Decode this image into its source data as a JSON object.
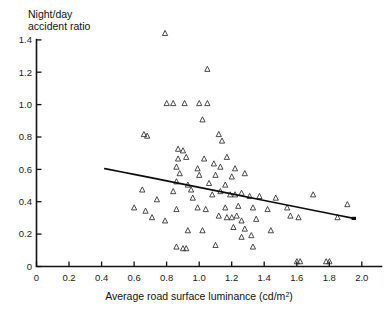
{
  "chart_data": {
    "type": "scatter",
    "title": "",
    "ylabel_line1": "Night/day",
    "ylabel_line2": "accident ratio",
    "xlabel_main": "Average road surface luminance (cd/m",
    "xlabel_sup": "2",
    "xlabel_tail": ")",
    "xlabel_full": "Average road surface luminance (cd/m2)",
    "ylabel_full": "Night/day accident ratio",
    "xlim": [
      0,
      2.12
    ],
    "ylim": [
      0,
      1.42
    ],
    "xticks": [
      0,
      0.2,
      0.4,
      0.6,
      0.8,
      1.0,
      1.2,
      1.4,
      1.6,
      1.8,
      2.0
    ],
    "xtick_labels": [
      "0",
      "0.2",
      "0.4",
      "0.6",
      "0.8",
      "1.0",
      "1.2",
      "1.4",
      "1.6",
      "1.8",
      "2.0"
    ],
    "yticks": [
      0,
      0.2,
      0.4,
      0.6,
      0.8,
      1.0,
      1.2,
      1.4
    ],
    "ytick_labels": [
      "0",
      "0.2",
      "0.4",
      "0.6",
      "0.8",
      "1.0",
      "1.2",
      "1.4"
    ],
    "grid": false,
    "legend": null,
    "marker_style": "open-triangle-up",
    "marker_color": "#2b2b2b",
    "trend_color": "#0d0d0d",
    "series": [
      {
        "name": "Night/day accident ratio vs luminance",
        "points": [
          [
            0.79,
            1.43
          ],
          [
            1.05,
            1.21
          ],
          [
            0.8,
            1.0
          ],
          [
            0.84,
            1.0
          ],
          [
            0.91,
            1.0
          ],
          [
            1.0,
            1.0
          ],
          [
            1.05,
            1.0
          ],
          [
            1.02,
            0.9
          ],
          [
            0.66,
            0.81
          ],
          [
            0.68,
            0.8
          ],
          [
            1.12,
            0.81
          ],
          [
            1.14,
            0.77
          ],
          [
            0.87,
            0.72
          ],
          [
            0.9,
            0.71
          ],
          [
            0.87,
            0.66
          ],
          [
            0.92,
            0.67
          ],
          [
            1.03,
            0.66
          ],
          [
            1.09,
            0.63
          ],
          [
            1.17,
            0.67
          ],
          [
            0.86,
            0.61
          ],
          [
            0.99,
            0.6
          ],
          [
            1.13,
            0.61
          ],
          [
            1.22,
            0.6
          ],
          [
            0.88,
            0.57
          ],
          [
            1.0,
            0.56
          ],
          [
            1.1,
            0.56
          ],
          [
            1.2,
            0.55
          ],
          [
            1.28,
            0.57
          ],
          [
            0.86,
            0.52
          ],
          [
            0.93,
            0.5
          ],
          [
            1.06,
            0.51
          ],
          [
            1.16,
            0.5
          ],
          [
            0.65,
            0.47
          ],
          [
            0.84,
            0.46
          ],
          [
            0.95,
            0.47
          ],
          [
            1.13,
            0.46
          ],
          [
            1.26,
            0.45
          ],
          [
            0.74,
            0.41
          ],
          [
            0.96,
            0.42
          ],
          [
            1.08,
            0.44
          ],
          [
            1.19,
            0.44
          ],
          [
            1.22,
            0.44
          ],
          [
            1.31,
            0.43
          ],
          [
            1.37,
            0.43
          ],
          [
            1.47,
            0.42
          ],
          [
            1.7,
            0.44
          ],
          [
            0.6,
            0.36
          ],
          [
            0.67,
            0.34
          ],
          [
            0.86,
            0.35
          ],
          [
            0.99,
            0.36
          ],
          [
            1.04,
            0.35
          ],
          [
            1.16,
            0.36
          ],
          [
            1.24,
            0.37
          ],
          [
            1.33,
            0.36
          ],
          [
            1.42,
            0.35
          ],
          [
            1.54,
            0.36
          ],
          [
            1.91,
            0.38
          ],
          [
            0.71,
            0.3
          ],
          [
            0.79,
            0.28
          ],
          [
            1.12,
            0.31
          ],
          [
            1.17,
            0.3
          ],
          [
            1.2,
            0.3
          ],
          [
            1.23,
            0.31
          ],
          [
            1.26,
            0.28
          ],
          [
            1.35,
            0.29
          ],
          [
            1.56,
            0.31
          ],
          [
            1.61,
            0.3
          ],
          [
            1.85,
            0.3
          ],
          [
            0.93,
            0.22
          ],
          [
            1.02,
            0.22
          ],
          [
            1.21,
            0.24
          ],
          [
            1.28,
            0.23
          ],
          [
            1.44,
            0.22
          ],
          [
            1.26,
            0.18
          ],
          [
            1.32,
            0.19
          ],
          [
            0.86,
            0.12
          ],
          [
            0.9,
            0.11
          ],
          [
            0.92,
            0.11
          ],
          [
            1.1,
            0.13
          ],
          [
            1.33,
            0.12
          ],
          [
            1.6,
            0.03
          ],
          [
            1.62,
            0.03
          ],
          [
            1.78,
            0.03
          ],
          [
            1.8,
            0.03
          ]
        ]
      }
    ],
    "trendline": {
      "name": "fitted regression curve",
      "type": "curve",
      "points": [
        [
          0.42,
          0.6
        ],
        [
          0.6,
          0.565
        ],
        [
          0.8,
          0.525
        ],
        [
          1.0,
          0.485
        ],
        [
          1.2,
          0.445
        ],
        [
          1.4,
          0.405
        ],
        [
          1.6,
          0.365
        ],
        [
          1.8,
          0.325
        ],
        [
          1.95,
          0.295
        ]
      ]
    }
  }
}
